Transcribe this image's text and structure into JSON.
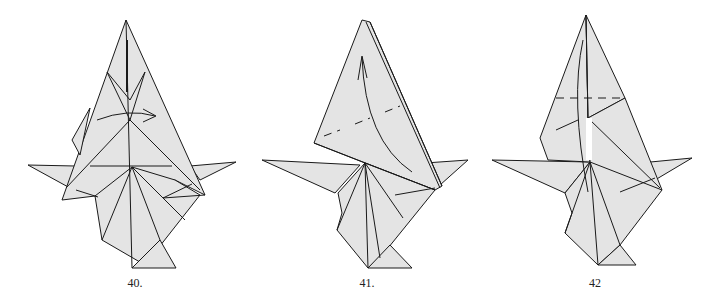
{
  "figure": {
    "type": "origami folding diagram",
    "fill_color": "#e4e4e4",
    "line_color": "#1a1a1a",
    "steps": [
      {
        "label": "40.",
        "annotations": [
          "curved arrow (fold flap right)",
          "valley fold creases"
        ]
      },
      {
        "label": "41.",
        "annotations": [
          "curved arrow (fold up)",
          "dashed fold lines"
        ]
      },
      {
        "label": "42",
        "annotations": [
          "horizontal dashed fold line",
          "curved arrow"
        ]
      }
    ]
  }
}
